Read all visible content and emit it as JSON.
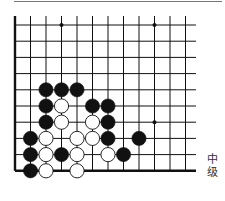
{
  "diagram": {
    "type": "go-problem",
    "level_label": "中级",
    "grid": {
      "columns": 12,
      "rows": 10,
      "x0": 15,
      "dx": 15.5,
      "y0": 25,
      "dy": 16.2,
      "right_extent": 196,
      "edges": [
        "left",
        "bottom"
      ]
    },
    "star_points": [
      [
        3,
        0
      ],
      [
        9,
        0
      ],
      [
        9,
        6
      ]
    ],
    "stones": [
      {
        "color": "black",
        "col": 2,
        "row": 4
      },
      {
        "color": "black",
        "col": 3,
        "row": 4
      },
      {
        "color": "black",
        "col": 4,
        "row": 4
      },
      {
        "color": "black",
        "col": 2,
        "row": 5
      },
      {
        "color": "white",
        "col": 3,
        "row": 5
      },
      {
        "color": "black",
        "col": 5,
        "row": 5
      },
      {
        "color": "black",
        "col": 6,
        "row": 5
      },
      {
        "color": "black",
        "col": 2,
        "row": 6
      },
      {
        "color": "white",
        "col": 3,
        "row": 6
      },
      {
        "color": "white",
        "col": 5,
        "row": 6
      },
      {
        "color": "black",
        "col": 6,
        "row": 6
      },
      {
        "color": "black",
        "col": 1,
        "row": 7
      },
      {
        "color": "white",
        "col": 2,
        "row": 7
      },
      {
        "color": "white",
        "col": 4,
        "row": 7
      },
      {
        "color": "white",
        "col": 5,
        "row": 7
      },
      {
        "color": "black",
        "col": 6,
        "row": 7
      },
      {
        "color": "black",
        "col": 8,
        "row": 7
      },
      {
        "color": "black",
        "col": 1,
        "row": 8
      },
      {
        "color": "white",
        "col": 2,
        "row": 8
      },
      {
        "color": "black",
        "col": 3,
        "row": 8
      },
      {
        "color": "white",
        "col": 4,
        "row": 8
      },
      {
        "color": "white",
        "col": 6,
        "row": 8
      },
      {
        "color": "black",
        "col": 7,
        "row": 8
      },
      {
        "color": "black",
        "col": 1,
        "row": 9
      },
      {
        "color": "white",
        "col": 2,
        "row": 9
      },
      {
        "color": "white",
        "col": 4,
        "row": 9
      }
    ]
  }
}
